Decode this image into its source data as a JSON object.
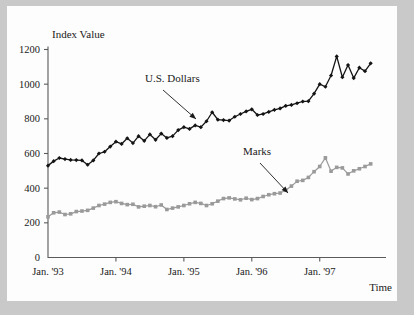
{
  "figure": {
    "background_color": "#c9c9c9",
    "plate_color": "#fdfdfd"
  },
  "chart_data": {
    "type": "line",
    "title": "",
    "subtitle": "",
    "xlabel": "Time",
    "ylabel": "Index Value",
    "ylim": [
      0,
      1280
    ],
    "yticks": [
      0,
      200,
      400,
      600,
      800,
      1000,
      1200
    ],
    "ytick_labels": [
      "0",
      "200",
      "400",
      "600",
      "800",
      "1000",
      "1200"
    ],
    "xlim": [
      0,
      59
    ],
    "xticks": [
      0,
      12,
      24,
      36,
      48
    ],
    "xtick_labels": [
      "Jan. '93",
      "Jan. '94",
      "Jan. '95",
      "Jan. '96",
      "Jan. '97"
    ],
    "grid": false,
    "legend": "annotations",
    "annotations": [
      {
        "label": "U.S. Dollars",
        "series": "U.S. Dollars",
        "text_x": 145,
        "text_y": 82,
        "arrow_from_x": 163,
        "arrow_from_y": 90,
        "arrow_to_x": 196,
        "arrow_to_y": 119
      },
      {
        "label": "Marks",
        "series": "Marks",
        "text_x": 243,
        "text_y": 155,
        "arrow_from_x": 260,
        "arrow_from_y": 163,
        "arrow_to_x": 288,
        "arrow_to_y": 193
      }
    ],
    "series": [
      {
        "name": "U.S. Dollars",
        "color": "#141414",
        "marker": "diamond",
        "values": [
          530,
          556,
          574,
          568,
          563,
          562,
          560,
          535,
          560,
          600,
          610,
          640,
          668,
          655,
          688,
          660,
          700,
          673,
          710,
          679,
          715,
          690,
          700,
          735,
          752,
          742,
          762,
          752,
          786,
          838,
          795,
          793,
          790,
          812,
          828,
          843,
          855,
          822,
          828,
          840,
          852,
          860,
          875,
          880,
          890,
          900,
          902,
          945,
          1000,
          985,
          1050,
          1160,
          1040,
          1110,
          1035,
          1095,
          1075,
          1120
        ]
      },
      {
        "name": "Marks",
        "color": "#9a9a9a",
        "marker": "square",
        "values": [
          235,
          258,
          262,
          248,
          252,
          265,
          268,
          272,
          285,
          300,
          308,
          318,
          322,
          312,
          305,
          307,
          292,
          296,
          300,
          293,
          303,
          277,
          285,
          292,
          300,
          310,
          318,
          312,
          300,
          310,
          325,
          340,
          344,
          338,
          333,
          342,
          334,
          340,
          352,
          362,
          368,
          372,
          388,
          412,
          440,
          445,
          462,
          495,
          525,
          575,
          498,
          520,
          517,
          482,
          500,
          512,
          525,
          540
        ]
      }
    ]
  }
}
